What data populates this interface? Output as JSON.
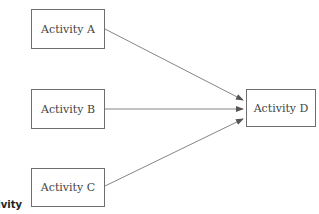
{
  "diagram": {
    "nodes": [
      {
        "id": "A",
        "label": "Activity A"
      },
      {
        "id": "B",
        "label": "Activity B"
      },
      {
        "id": "C",
        "label": "Activity C"
      },
      {
        "id": "D",
        "label": "Activity D"
      }
    ],
    "edges": [
      {
        "from": "A",
        "to": "D"
      },
      {
        "from": "B",
        "to": "D"
      },
      {
        "from": "C",
        "to": "D"
      }
    ],
    "cropped_label": "Activity"
  },
  "colors": {
    "line": "#6e6e6e",
    "text": "#444444"
  }
}
